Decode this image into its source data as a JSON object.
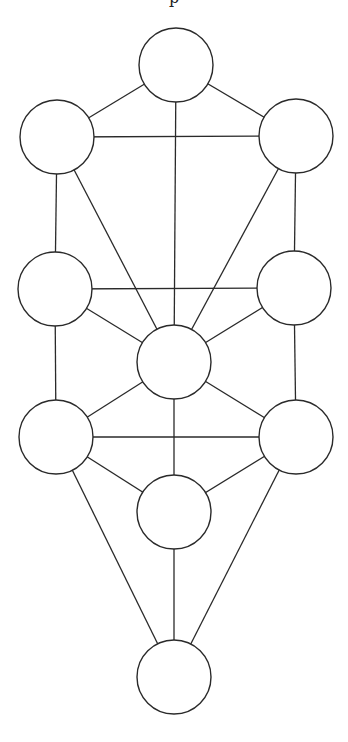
{
  "diagram": {
    "title_fragment": "p",
    "stroke_color": "#2a2a2a",
    "fill_color": "#ffffff",
    "radius": 37,
    "nodes": [
      {
        "id": "n1",
        "x": 176,
        "y": 65
      },
      {
        "id": "n2",
        "x": 57,
        "y": 137
      },
      {
        "id": "n3",
        "x": 296,
        "y": 136
      },
      {
        "id": "n4",
        "x": 55,
        "y": 289
      },
      {
        "id": "n5",
        "x": 294,
        "y": 288
      },
      {
        "id": "n6",
        "x": 174,
        "y": 362
      },
      {
        "id": "n7",
        "x": 56,
        "y": 437
      },
      {
        "id": "n8",
        "x": 296,
        "y": 437
      },
      {
        "id": "n9",
        "x": 174,
        "y": 512
      },
      {
        "id": "n10",
        "x": 174,
        "y": 677
      }
    ],
    "edges": [
      [
        "n1",
        "n2"
      ],
      [
        "n1",
        "n3"
      ],
      [
        "n1",
        "n6"
      ],
      [
        "n2",
        "n3"
      ],
      [
        "n2",
        "n4"
      ],
      [
        "n2",
        "n6"
      ],
      [
        "n3",
        "n5"
      ],
      [
        "n3",
        "n6"
      ],
      [
        "n4",
        "n5"
      ],
      [
        "n4",
        "n6"
      ],
      [
        "n5",
        "n6"
      ],
      [
        "n4",
        "n7"
      ],
      [
        "n5",
        "n8"
      ],
      [
        "n6",
        "n7"
      ],
      [
        "n6",
        "n8"
      ],
      [
        "n6",
        "n9"
      ],
      [
        "n7",
        "n8"
      ],
      [
        "n7",
        "n9"
      ],
      [
        "n8",
        "n9"
      ],
      [
        "n7",
        "n10"
      ],
      [
        "n8",
        "n10"
      ],
      [
        "n9",
        "n10"
      ]
    ]
  }
}
